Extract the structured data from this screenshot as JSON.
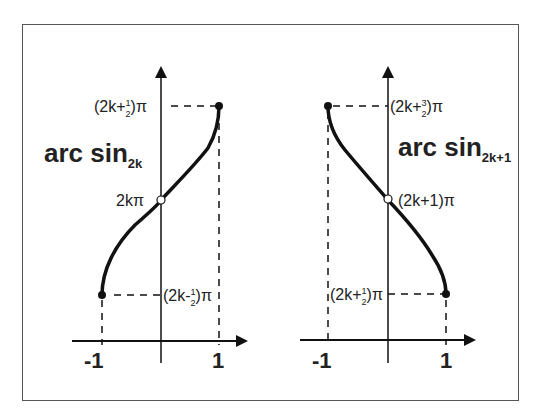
{
  "diagram": {
    "left": {
      "title": "arc sin",
      "subscript": "2k",
      "y_top_label": "(2k+½)π",
      "y_mid_label": "2kπ",
      "y_bottom_label": "(2k-½)π",
      "x_left_label": "-1",
      "x_right_label": "1"
    },
    "right": {
      "title": "arc sin",
      "subscript": "2k+1",
      "y_top_label": "(2k+3/2)π",
      "y_mid_label": "(2k+1)π",
      "y_bottom_label": "(2k+½)π",
      "x_left_label": "-1",
      "x_right_label": "1"
    }
  }
}
